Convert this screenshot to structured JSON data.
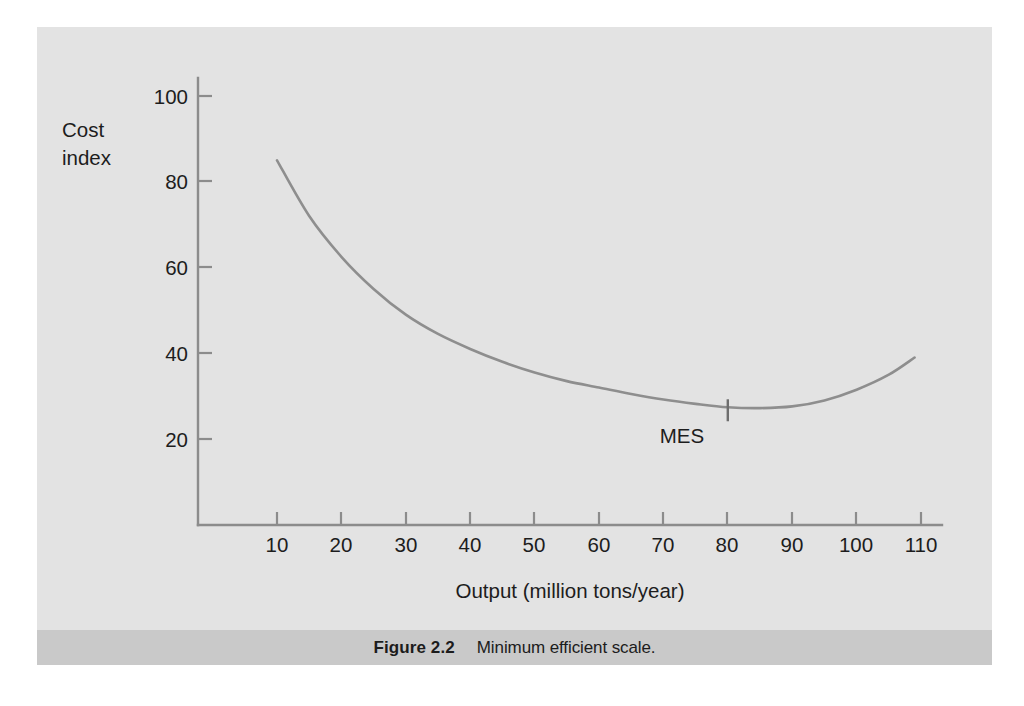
{
  "figure": {
    "caption_label": "Figure 2.2",
    "caption_text": "Minimum efficient scale.",
    "panel_color": "#e3e3e3",
    "caption_band_color": "#c9c9c9",
    "page_background": "#ffffff"
  },
  "chart_data": {
    "type": "line",
    "title": "",
    "subtitle": "",
    "xlabel": "Output (million tons/year)",
    "ylabel": "Cost index",
    "ylabel_lines": [
      "Cost",
      "index"
    ],
    "xlim": [
      0,
      115
    ],
    "ylim": [
      0,
      108
    ],
    "xticks": [
      10,
      20,
      30,
      40,
      50,
      60,
      70,
      80,
      90,
      100,
      110
    ],
    "xticklabels": [
      "10",
      "20",
      "30",
      "40",
      "50",
      "60",
      "70",
      "80",
      "90",
      "100",
      "110"
    ],
    "yticks": [
      20,
      40,
      60,
      80,
      100
    ],
    "yticklabels": [
      "20",
      "40",
      "60",
      "80",
      "100"
    ],
    "grid": false,
    "legend": false,
    "line_color": "#8e8e8e",
    "axis_color": "#8c8c8c",
    "series": [
      {
        "name": "Long-run average cost",
        "x": [
          10,
          15,
          20,
          25,
          30,
          35,
          40,
          45,
          50,
          55,
          60,
          65,
          70,
          75,
          80,
          85,
          90,
          95,
          100,
          105,
          109
        ],
        "values": [
          85,
          72,
          62.5,
          55,
          49,
          44.5,
          41,
          38,
          35.5,
          33.5,
          32,
          30.5,
          29.2,
          28.2,
          27.4,
          27.2,
          27.6,
          29,
          31.5,
          35,
          39
        ]
      }
    ],
    "annotations": [
      {
        "label": "MES",
        "x": 80,
        "y": 27.4,
        "note": "Minimum efficient scale tick mark on the curve at output = 80"
      }
    ]
  }
}
